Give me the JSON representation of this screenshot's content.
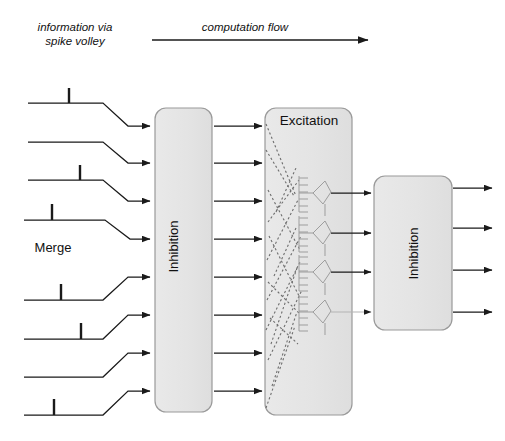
{
  "figure": {
    "captions": {
      "information_via_spike_volley": "information via\nspike volley",
      "computation_flow": "computation flow"
    },
    "labels": {
      "merge": "Merge",
      "inhibition_1": "Inhibition",
      "excitation": "Excitation",
      "inhibition_2": "Inhibition"
    },
    "colors": {
      "stroke": "#1a1a1a",
      "box_fill": "#e6e6e6",
      "box_stroke": "#9a9a9a",
      "neuron_stroke": "#9d9d9d",
      "dotted_axon": "#7d7d7d",
      "background": "#ffffff"
    },
    "blocks": [
      {
        "name": "inhibition-1",
        "label": "Inhibition",
        "x": 155,
        "y": 108,
        "w": 57,
        "h": 304,
        "orientation": "vertical"
      },
      {
        "name": "excitation",
        "label": "Excitation",
        "x": 265,
        "y": 108,
        "w": 87,
        "h": 307,
        "orientation": "horizontal"
      },
      {
        "name": "inhibition-2",
        "label": "Inhibition",
        "x": 374,
        "y": 176,
        "w": 78,
        "h": 154,
        "orientation": "vertical"
      }
    ],
    "flow_arrow": {
      "x1": 152,
      "y1": 40,
      "x2": 372,
      "y2": 40,
      "direction": "right"
    },
    "input_lines": [
      {
        "index": 1,
        "y_flat": 103,
        "y_arrow": 126,
        "spike": true,
        "spike_x": 69
      },
      {
        "index": 2,
        "y_flat": 142,
        "y_arrow": 163,
        "spike": false,
        "spike_x": null
      },
      {
        "index": 3,
        "y_flat": 180,
        "y_arrow": 201,
        "spike": true,
        "spike_x": 80
      },
      {
        "index": 4,
        "y_flat": 220,
        "y_arrow": 239,
        "spike": true,
        "spike_x": 52
      },
      {
        "index": 5,
        "y_flat": 300,
        "y_arrow": 277,
        "spike": true,
        "spike_x": 61
      },
      {
        "index": 6,
        "y_flat": 339,
        "y_arrow": 315,
        "spike": true,
        "spike_x": 81
      },
      {
        "index": 7,
        "y_flat": 377,
        "y_arrow": 353,
        "spike": false,
        "spike_x": null
      },
      {
        "index": 8,
        "y_flat": 415,
        "y_arrow": 391,
        "spike": true,
        "spike_x": 54
      }
    ],
    "middle_arrows_y": [
      126,
      163,
      201,
      239,
      277,
      315,
      353,
      391
    ],
    "excitation_to_inhibition_arrows_y": [
      193,
      233,
      272,
      312
    ],
    "output_arrows_y": [
      188,
      228,
      270,
      312
    ],
    "neurons": [
      {
        "index": 1,
        "soma_x": 318,
        "soma_y": 193,
        "dendrite_count": 6
      },
      {
        "index": 2,
        "soma_x": 318,
        "soma_y": 233,
        "dendrite_count": 6
      },
      {
        "index": 3,
        "soma_x": 318,
        "soma_y": 272,
        "dendrite_count": 6
      },
      {
        "index": 4,
        "soma_x": 318,
        "soma_y": 312,
        "dendrite_count": 6
      }
    ],
    "counts": {
      "input_channels": 8,
      "middle_channels": 8,
      "excitatory_neurons": 4,
      "output_channels": 4
    }
  }
}
